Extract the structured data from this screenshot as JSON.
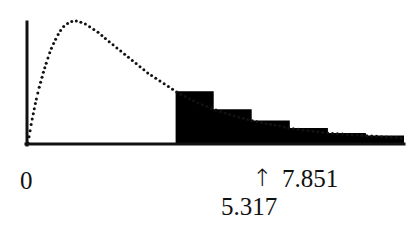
{
  "figure": {
    "name": "chi-square-density-with-rejection-region",
    "background_color": "#ffffff",
    "ink_color": "#111111",
    "fill_color": "#000000"
  },
  "labels": {
    "origin": "0",
    "arrow": "↑",
    "critical_value": "7.851",
    "test_statistic": "5.317"
  },
  "chart_data": {
    "type": "area",
    "title": "",
    "xlabel": "",
    "ylabel": "",
    "grid": false,
    "legend": null,
    "axis": {
      "x_axis_drawn": true,
      "y_axis_drawn": true,
      "x_origin_label": "0",
      "x_tick_labels": [
        "0",
        "5.317",
        "7.851"
      ],
      "xlim": [
        0,
        20
      ],
      "ylim": [
        0,
        1
      ]
    },
    "annotations": [
      {
        "name": "test-statistic-pointer",
        "glyph": "↑",
        "label": "5.317",
        "x_value": 5.317,
        "points_to": "x-axis"
      },
      {
        "name": "critical-value-label",
        "label": "7.851",
        "x_value": 7.851
      }
    ],
    "shaded_region": {
      "name": "rejection-region",
      "from_x": 7.851,
      "to_x": 20,
      "style": "solid-black-stepped",
      "step_count": 6
    },
    "series": [
      {
        "name": "density-curve",
        "style": "dotted",
        "x": [
          0.0,
          0.2,
          0.4,
          0.6,
          0.8,
          1.0,
          1.2,
          1.4,
          1.6,
          1.8,
          2.0,
          2.2,
          2.4,
          2.6,
          2.8,
          3.0,
          3.2,
          3.4,
          3.6,
          3.8,
          4.0,
          4.4,
          4.8,
          5.2,
          5.6,
          6.0,
          6.4,
          6.8,
          7.2,
          7.6,
          8.0,
          8.5,
          9.0,
          9.5,
          10.0,
          11.0,
          12.0,
          13.0,
          14.0,
          15.0,
          16.0,
          17.0,
          18.0,
          19.0,
          20.0
        ],
        "y": [
          0.0,
          0.18,
          0.33,
          0.46,
          0.57,
          0.67,
          0.76,
          0.83,
          0.89,
          0.94,
          0.97,
          0.99,
          1.0,
          1.0,
          0.99,
          0.98,
          0.96,
          0.94,
          0.92,
          0.9,
          0.87,
          0.82,
          0.77,
          0.72,
          0.67,
          0.62,
          0.57,
          0.53,
          0.49,
          0.45,
          0.41,
          0.37,
          0.33,
          0.3,
          0.27,
          0.22,
          0.18,
          0.15,
          0.12,
          0.1,
          0.08,
          0.07,
          0.06,
          0.05,
          0.04
        ]
      }
    ]
  }
}
